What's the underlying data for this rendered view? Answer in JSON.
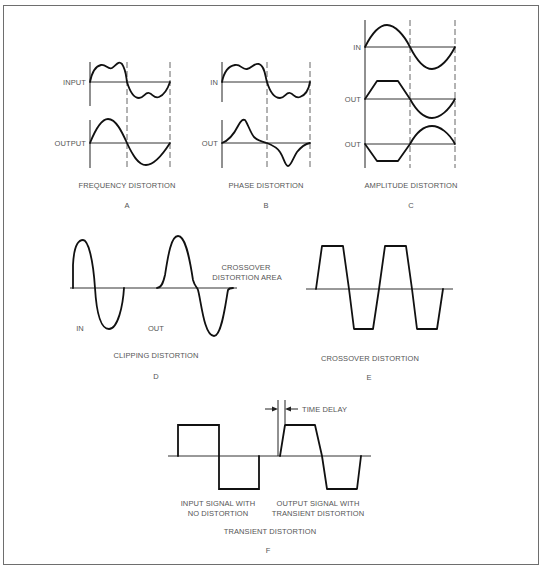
{
  "figure": {
    "panels": [
      {
        "id": "A",
        "title": "FREQUENCY DISTORTION",
        "letter": "A",
        "signal_labels": [
          "INPUT",
          "OUTPUT"
        ]
      },
      {
        "id": "B",
        "title": "PHASE DISTORTION",
        "letter": "B",
        "signal_labels": [
          "IN",
          "OUT"
        ]
      },
      {
        "id": "C",
        "title": "AMPLITUDE DISTORTION",
        "letter": "C",
        "signal_labels": [
          "IN",
          "OUT",
          "OUT"
        ]
      },
      {
        "id": "D",
        "title": "CLIPPING DISTORTION",
        "letter": "D",
        "signal_labels": [
          "IN",
          "OUT"
        ],
        "annotation": [
          "CROSSOVER",
          "DISTORTION AREA"
        ]
      },
      {
        "id": "E",
        "title": "CROSSOVER DISTORTION",
        "letter": "E"
      },
      {
        "id": "F",
        "title": "TRANSIENT DISTORTION",
        "letter": "F",
        "annotation": "TIME DELAY",
        "input_caption": [
          "INPUT SIGNAL WITH",
          "NO DISTORTION"
        ],
        "output_caption": [
          "OUTPUT SIGNAL WITH",
          "TRANSIENT DISTORTION"
        ]
      }
    ]
  }
}
